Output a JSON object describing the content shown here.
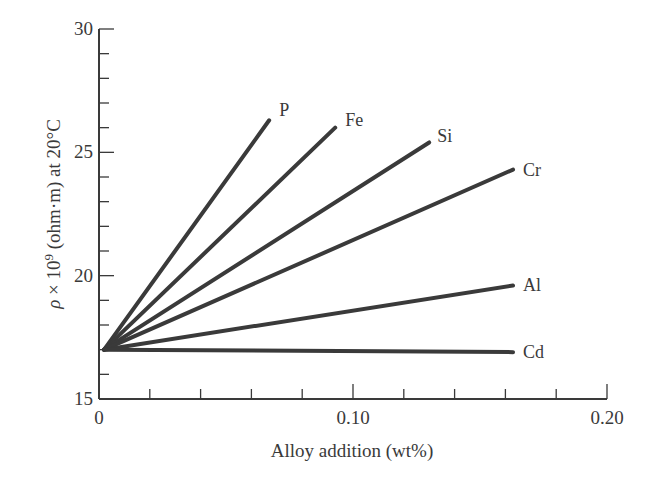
{
  "chart_data": {
    "type": "line",
    "title": "",
    "xlabel": "Alloy addition (wt%)",
    "ylabel": "ρ × 10⁹ (ohm·m) at 20°C",
    "xlim": [
      0,
      0.2
    ],
    "ylim": [
      15,
      30
    ],
    "x_ticks": [
      0,
      0.1,
      0.2
    ],
    "x_tick_labels": [
      "0",
      "0.10",
      "0.20"
    ],
    "x_minor_step": 0.02,
    "y_ticks": [
      15,
      20,
      25,
      30
    ],
    "y_tick_labels": [
      "15",
      "20",
      "25",
      "30"
    ],
    "y_minor_step": 1,
    "grid": false,
    "legend": "inline labels at line ends",
    "series": [
      {
        "name": "P",
        "x": [
          0.002,
          0.067
        ],
        "y": [
          17.0,
          26.3
        ]
      },
      {
        "name": "Fe",
        "x": [
          0.002,
          0.093
        ],
        "y": [
          17.0,
          26.0
        ]
      },
      {
        "name": "Si",
        "x": [
          0.002,
          0.13
        ],
        "y": [
          17.0,
          25.4
        ]
      },
      {
        "name": "Cr",
        "x": [
          0.002,
          0.163
        ],
        "y": [
          17.0,
          24.3
        ]
      },
      {
        "name": "Al",
        "x": [
          0.002,
          0.163
        ],
        "y": [
          17.0,
          19.6
        ]
      },
      {
        "name": "Cd",
        "x": [
          0.002,
          0.163
        ],
        "y": [
          17.0,
          16.9
        ]
      }
    ],
    "line_color": "#3a3a3a"
  }
}
